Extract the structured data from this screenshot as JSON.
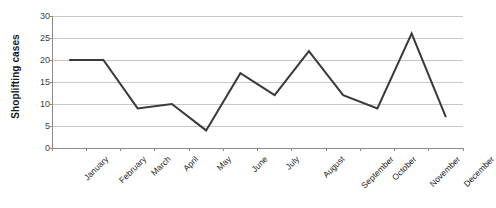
{
  "chart_data": {
    "type": "line",
    "title": "",
    "subtitle": "",
    "xlabel": "",
    "ylabel": "Shoplifting cases",
    "categories": [
      "January",
      "February",
      "March",
      "April",
      "May",
      "June",
      "July",
      "August",
      "September",
      "October",
      "November",
      "December"
    ],
    "values": [
      20,
      20,
      9,
      10,
      4,
      17,
      12,
      22,
      12,
      9,
      26,
      7
    ],
    "series": [
      {
        "name": "Shoplifting cases",
        "values": [
          20,
          20,
          9,
          10,
          4,
          17,
          12,
          22,
          12,
          9,
          26,
          7
        ]
      }
    ],
    "ylim": [
      0,
      30
    ],
    "yticks": [
      0,
      5,
      10,
      15,
      20,
      25,
      30
    ],
    "ytick_labels": [
      "0",
      "5",
      "10",
      "15",
      "20",
      "25",
      "30"
    ],
    "grid": true,
    "grid_axis": "y",
    "legend": false,
    "legend_position": "none",
    "markers": false,
    "annotations": [],
    "colors": {
      "line": "#3a3a3a",
      "grid": "#c8c8c8",
      "axis": "#8c8c8c",
      "text": "#262626",
      "background": "#ffffff"
    }
  }
}
